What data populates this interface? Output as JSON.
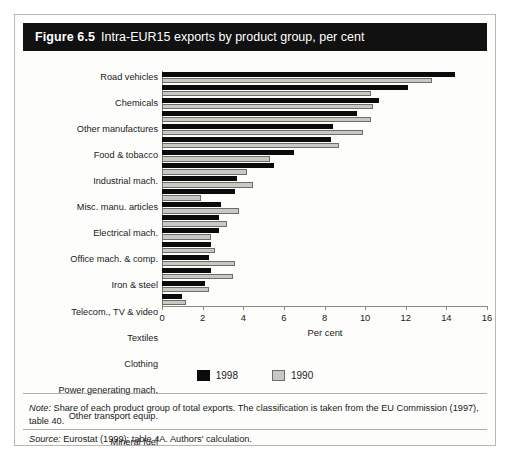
{
  "figure": {
    "number": "Figure 6.5",
    "title": "Intra-EUR15 exports by product group, per cent"
  },
  "notes": {
    "note_keyword": "Note:",
    "note_text": " Share of each product group of total exports. The classification is taken from the EU Commission (1997), table 40.",
    "source_keyword": "Source:",
    "source_text": " Eurostat (1999): table 4A. Authors' calculation."
  },
  "colors": {
    "series_1998": "#0b0b0b",
    "series_1990": "#c9c9c4",
    "title_bar": "#111111",
    "frame": "#b9b9b4"
  },
  "chart_data": {
    "type": "bar",
    "orientation": "horizontal",
    "title": "Intra-EUR15 exports by product group, per cent",
    "xlabel": "Per cent",
    "ylabel": "",
    "xlim": [
      0,
      16
    ],
    "xticks": [
      0,
      2,
      4,
      6,
      8,
      10,
      12,
      14,
      16
    ],
    "grid": false,
    "legend_position": "bottom",
    "categories": [
      "Road vehicles",
      "Chemicals",
      "Other manufactures",
      "Food & tobacco",
      "Industrial mach.",
      "Misc. manu. articles",
      "Electrical mach.",
      "Office mach. & comp.",
      "Iron & steel",
      "Telecom., TV & video",
      "Textiles",
      "Clothing",
      "Power generating mach.",
      "Other transport equip.",
      "Mineral fuel",
      "Non-fuel materials",
      "Non-ferrous metals",
      "Footwear"
    ],
    "series": [
      {
        "name": "1998",
        "color": "#0b0b0b",
        "values": [
          14.4,
          12.1,
          10.7,
          9.6,
          8.4,
          8.3,
          6.5,
          5.5,
          3.7,
          3.6,
          2.9,
          2.8,
          2.8,
          2.4,
          2.3,
          2.4,
          2.1,
          1.0
        ]
      },
      {
        "name": "1990",
        "color": "#c9c9c4",
        "values": [
          13.3,
          10.3,
          10.4,
          10.3,
          9.9,
          8.7,
          5.3,
          4.2,
          4.5,
          1.9,
          3.8,
          3.2,
          2.4,
          2.6,
          3.6,
          3.5,
          2.3,
          1.2
        ]
      }
    ]
  }
}
